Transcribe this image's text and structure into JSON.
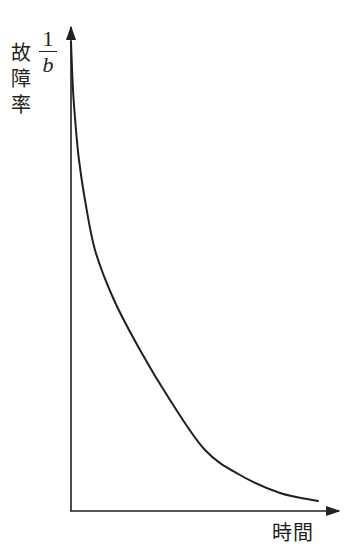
{
  "chart_data": {
    "type": "line",
    "title": "",
    "xlabel": "時間",
    "ylabel": "故障率",
    "ylabel_annotation": {
      "numerator": "1",
      "denominator": "b"
    },
    "grid": false,
    "legend": null,
    "axes": {
      "x_ticks": [],
      "y_ticks": [],
      "arrows": true
    },
    "series": [
      {
        "name": "故障率曲線",
        "description": "Decreasing failure rate curve (early-failure / infant-mortality type), monotonically decreasing and convex, starting at 1/b near the top of the y-axis and approaching zero as time increases",
        "points_px": [
          [
            71,
            42
          ],
          [
            73,
            90
          ],
          [
            76,
            130
          ],
          [
            79,
            160
          ],
          [
            85,
            200
          ],
          [
            95,
            250
          ],
          [
            114,
            300
          ],
          [
            140,
            350
          ],
          [
            170,
            400
          ],
          [
            205,
            450
          ],
          [
            240,
            475
          ],
          [
            280,
            493
          ],
          [
            318,
            501
          ]
        ]
      }
    ],
    "origin_px": [
      70,
      511
    ],
    "x_axis_end_px": [
      341,
      511
    ],
    "y_axis_end_px": [
      71,
      25
    ]
  },
  "labels": {
    "y_axis_chars": [
      "故",
      "障",
      "率"
    ],
    "fraction_numerator": "1",
    "fraction_denominator": "b",
    "x_axis": "時間"
  },
  "colors": {
    "ink": "#231f20",
    "background": "#ffffff"
  }
}
